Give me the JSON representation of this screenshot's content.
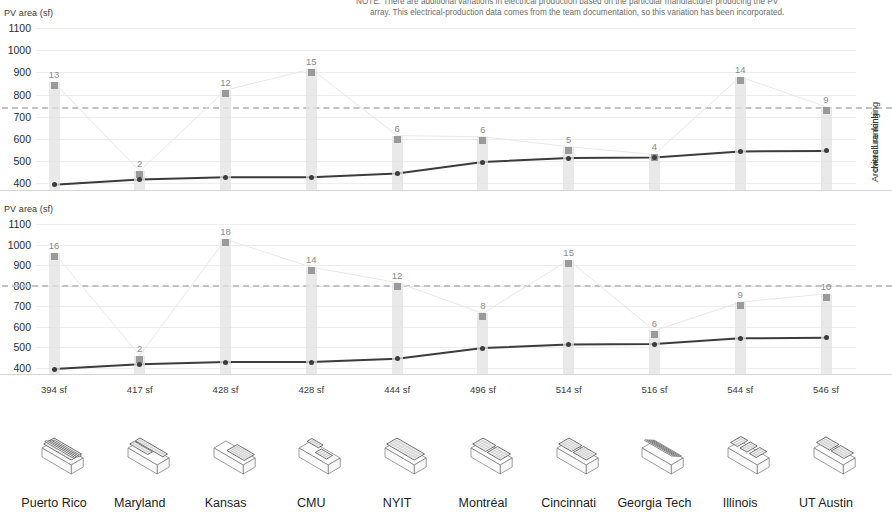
{
  "note": {
    "line1": "NOTE: There are additional variations in electrical production based on the particular manufacturer producing the PV",
    "line2": "array. This electrical-production data comes from the team documentation, so this variation has been incorporated."
  },
  "axes": {
    "y_title": "PV area (sf)",
    "y_ticks": [
      1100,
      1000,
      900,
      800,
      700,
      600,
      500,
      400
    ],
    "y_min": 370,
    "y_max": 1100,
    "top_right_label": "Architecture ranking",
    "bottom_right_label": "overall ranking"
  },
  "colors": {
    "pv_line": "#3c3c3c",
    "bar": "#e2e2e2",
    "bar_cap": "#9a9a9a",
    "rank_link": "#e8e8e8",
    "refline": "#c2c2c2",
    "grid": "#ededed"
  },
  "teams": [
    {
      "name": "Puerto Rico",
      "pv_sf": 394,
      "pv_label": "394 sf",
      "arch_rank": 13,
      "arch_value": 855,
      "overall_rank": 16,
      "overall_value": 960
    },
    {
      "name": "Maryland",
      "pv_sf": 417,
      "pv_label": "417 sf",
      "arch_rank": 2,
      "arch_value": 455,
      "overall_rank": 2,
      "overall_value": 460
    },
    {
      "name": "Kansas",
      "pv_sf": 428,
      "pv_label": "428 sf",
      "arch_rank": 12,
      "arch_value": 820,
      "overall_rank": 18,
      "overall_value": 1025
    },
    {
      "name": "CMU",
      "pv_sf": 428,
      "pv_label": "428 sf",
      "arch_rank": 15,
      "arch_value": 915,
      "overall_rank": 14,
      "overall_value": 890
    },
    {
      "name": "NYIT",
      "pv_sf": 444,
      "pv_label": "444 sf",
      "arch_rank": 6,
      "arch_value": 615,
      "overall_rank": 12,
      "overall_value": 815
    },
    {
      "name": "Montréal",
      "pv_sf": 496,
      "pv_label": "496 sf",
      "arch_rank": 6,
      "arch_value": 610,
      "overall_rank": 8,
      "overall_value": 665
    },
    {
      "name": "Cincinnati",
      "pv_sf": 514,
      "pv_label": "514 sf",
      "arch_rank": 5,
      "arch_value": 565,
      "overall_rank": 15,
      "overall_value": 925
    },
    {
      "name": "Georgia Tech",
      "pv_sf": 516,
      "pv_label": "516 sf",
      "arch_rank": 4,
      "arch_value": 530,
      "overall_rank": 6,
      "overall_value": 580
    },
    {
      "name": "Illinois",
      "pv_sf": 544,
      "pv_label": "544 sf",
      "arch_rank": 14,
      "arch_value": 880,
      "overall_rank": 9,
      "overall_value": 720
    },
    {
      "name": "UT Austin",
      "pv_sf": 546,
      "pv_label": "546 sf",
      "arch_rank": 9,
      "arch_value": 745,
      "overall_rank": 10,
      "overall_value": 760
    }
  ],
  "chart_data": {
    "type": "line",
    "xlabel": "",
    "ylabel": "PV area (sf)",
    "ylim": [
      370,
      1100
    ],
    "grid": true,
    "legend": "none",
    "categories": [
      "Puerto Rico",
      "Maryland",
      "Kansas",
      "CMU",
      "NYIT",
      "Montréal",
      "Cincinnati",
      "Georgia Tech",
      "Illinois",
      "UT Austin"
    ],
    "x_tick_labels": [
      "394 sf",
      "417 sf",
      "428 sf",
      "428 sf",
      "444 sf",
      "496 sf",
      "514 sf",
      "516 sf",
      "544 sf",
      "546 sf"
    ],
    "panels": [
      {
        "name": "Architecture ranking",
        "reference_line_value": 745,
        "series": [
          {
            "name": "PV area (sf)",
            "type": "line",
            "values": [
              394,
              417,
              428,
              428,
              444,
              496,
              514,
              516,
              544,
              546
            ]
          },
          {
            "name": "Architecture ranking",
            "type": "bar-marker",
            "values": [
              13,
              2,
              12,
              15,
              6,
              6,
              5,
              4,
              14,
              9
            ],
            "plotted_heights_sf": [
              855,
              455,
              820,
              915,
              615,
              610,
              565,
              530,
              880,
              745
            ]
          }
        ]
      },
      {
        "name": "overall ranking",
        "reference_line_value": 805,
        "series": [
          {
            "name": "PV area (sf)",
            "type": "line",
            "values": [
              394,
              417,
              428,
              428,
              444,
              496,
              514,
              516,
              544,
              546
            ]
          },
          {
            "name": "overall ranking",
            "type": "bar-marker",
            "values": [
              16,
              2,
              18,
              14,
              12,
              8,
              15,
              6,
              9,
              10
            ],
            "plotted_heights_sf": [
              960,
              460,
              1025,
              890,
              815,
              665,
              925,
              580,
              720,
              760
            ]
          }
        ]
      }
    ]
  }
}
